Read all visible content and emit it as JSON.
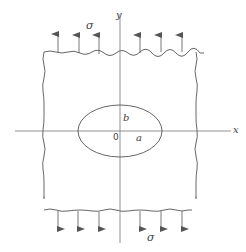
{
  "figure": {
    "colors": {
      "line": "#555555",
      "axis": "#777777",
      "background": "#ffffff"
    },
    "labels": {
      "y_axis": "y",
      "x_axis": "x",
      "stress_top": "σ",
      "stress_bottom": "σ",
      "semi_minor": "b",
      "semi_major": "a",
      "origin": "0"
    },
    "stress_arrows": {
      "top_count": 6,
      "bottom_count": 6,
      "direction_top": "up",
      "direction_bottom": "down"
    }
  }
}
